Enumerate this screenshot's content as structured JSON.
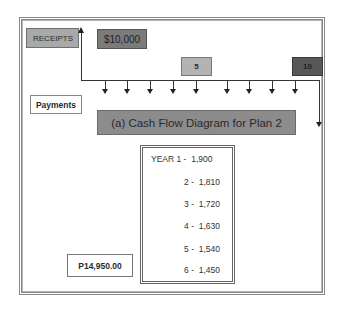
{
  "diagram": {
    "title": "(a) Cash Flow Diagram for Plan 2",
    "receipts_label": "RECEIPTS",
    "receipt_amount": "$10,000",
    "payments_label": "Payments",
    "timeline_markers": [
      {
        "label": "5",
        "color": "#b3b3b3"
      },
      {
        "label": "10",
        "color": "#585858"
      }
    ],
    "payment_schedule": [
      {
        "label": "YEAR 1 -  1,900"
      },
      {
        "label": "2 -  1,810"
      },
      {
        "label": "3 -  1,720"
      },
      {
        "label": "4 -  1,630"
      },
      {
        "label": "5 -  1,540"
      },
      {
        "label": "6 -  1,450"
      }
    ],
    "total": "P14,950.00",
    "payment_arrow_count": 10
  }
}
